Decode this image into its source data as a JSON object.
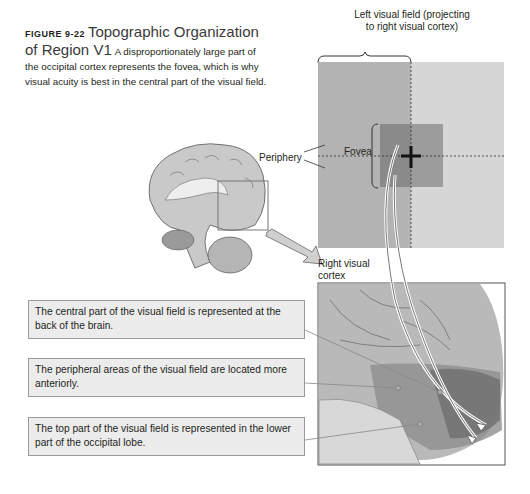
{
  "caption": {
    "figure_number": "FIGURE 9-22",
    "title": "Topographic Organization of Region V1",
    "text": "A disproportionately large part of the occipital cortex represents the fovea, which is why visual acuity is best in the central part of the visual field."
  },
  "visual_field": {
    "label_line1": "Left visual field (projecting",
    "label_line2": "to right visual cortex)",
    "fovea_label": "Fovea",
    "periphery_label": "Periphery"
  },
  "cortex": {
    "label_line1": "Right visual",
    "label_line2": "cortex"
  },
  "callouts": [
    {
      "text": "The central part of the visual field is represented at the back of the brain."
    },
    {
      "text": "The peripheral areas of the visual field are located more anteriorly."
    },
    {
      "text": "The top part of the visual field is represented in the lower part of the occipital lobe."
    }
  ],
  "colors": {
    "left_field": "#b3b3b3",
    "right_field": "#d6d6d6",
    "fovea": "#8a8a8a",
    "callout_bg": "#ececec",
    "callout_border": "#9a9a9a"
  }
}
